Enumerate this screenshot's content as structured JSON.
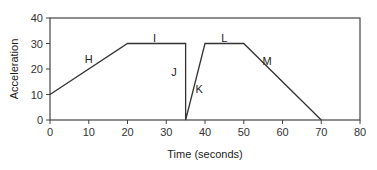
{
  "chart_data": {
    "type": "line",
    "title": "",
    "xlabel": "Time (seconds)",
    "ylabel": "Acceleration",
    "xlim": [
      0,
      80
    ],
    "ylim": [
      0,
      40
    ],
    "xticks": [
      0,
      10,
      20,
      30,
      40,
      50,
      60,
      70,
      80
    ],
    "yticks": [
      0,
      10,
      20,
      30,
      40
    ],
    "grid": false,
    "legend": null,
    "series": [
      {
        "name": "acceleration",
        "x": [
          0,
          20,
          35,
          35,
          40,
          50,
          70
        ],
        "y": [
          10,
          30,
          30,
          0,
          30,
          30,
          0
        ]
      }
    ],
    "annotations": [
      {
        "text": "H",
        "x": 10,
        "y": 24
      },
      {
        "text": "I",
        "x": 27,
        "y": 32
      },
      {
        "text": "J",
        "x": 32,
        "y": 19
      },
      {
        "text": "K",
        "x": 38.5,
        "y": 12
      },
      {
        "text": "L",
        "x": 45,
        "y": 32
      },
      {
        "text": "M",
        "x": 56,
        "y": 23
      }
    ]
  }
}
